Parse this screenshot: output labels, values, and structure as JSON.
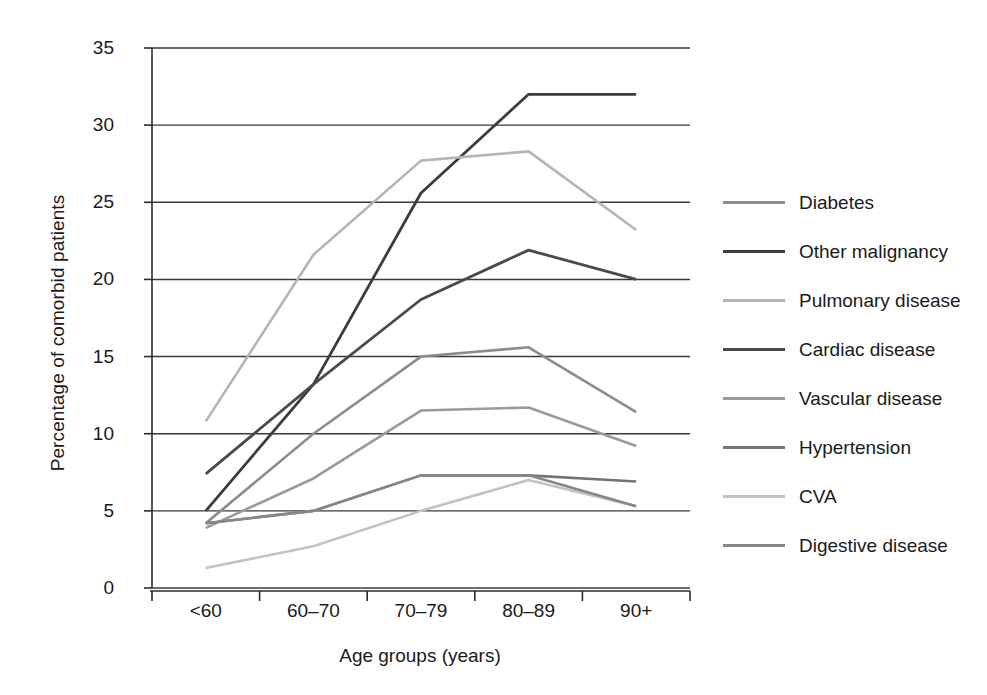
{
  "chart_data": {
    "type": "line",
    "title": "",
    "xlabel": "Age groups (years)",
    "ylabel": "Percentage of comorbid patients",
    "categories": [
      "<60",
      "60–70",
      "70–79",
      "80–89",
      "90+"
    ],
    "ylim": [
      0,
      35
    ],
    "yticks": [
      0,
      5,
      10,
      15,
      20,
      25,
      30,
      35
    ],
    "ytick_labels": [
      "0",
      "5",
      "10",
      "15",
      "20",
      "25",
      "30",
      "35"
    ],
    "grid": "horizontal",
    "legend_position": "right",
    "series": [
      {
        "name": "Diabetes",
        "color": "#8c8c8c",
        "width": 2.6,
        "values": [
          4.2,
          10.0,
          15.0,
          15.6,
          11.4
        ]
      },
      {
        "name": "Other malignancy",
        "color": "#3c3c3c",
        "width": 2.8,
        "values": [
          5.0,
          13.2,
          25.6,
          32.0,
          32.0
        ]
      },
      {
        "name": "Pulmonary disease",
        "color": "#b5b5b5",
        "width": 2.6,
        "values": [
          10.8,
          21.6,
          27.7,
          28.3,
          23.2
        ]
      },
      {
        "name": "Cardiac disease",
        "color": "#4a4a4a",
        "width": 2.8,
        "values": [
          7.4,
          13.2,
          18.7,
          21.9,
          20.0
        ]
      },
      {
        "name": "Vascular disease",
        "color": "#9a9a9a",
        "width": 2.6,
        "values": [
          3.9,
          7.1,
          11.5,
          11.7,
          9.2
        ]
      },
      {
        "name": "Hypertension",
        "color": "#757575",
        "width": 2.6,
        "values": [
          4.2,
          5.0,
          7.3,
          7.3,
          6.9
        ]
      },
      {
        "name": "CVA",
        "color": "#c2c2c2",
        "width": 2.6,
        "values": [
          1.3,
          2.7,
          5.0,
          7.0,
          5.3
        ]
      },
      {
        "name": "Digestive disease",
        "color": "#878787",
        "width": 2.6,
        "values": [
          4.2,
          5.0,
          7.3,
          7.3,
          5.3
        ]
      }
    ]
  },
  "legend": {
    "items": [
      {
        "label": "Diabetes"
      },
      {
        "label": "Other malignancy"
      },
      {
        "label": "Pulmonary disease"
      },
      {
        "label": "Cardiac disease"
      },
      {
        "label": "Vascular disease"
      },
      {
        "label": "Hypertension"
      },
      {
        "label": "CVA"
      },
      {
        "label": "Digestive disease"
      }
    ]
  },
  "axes": {
    "y_title": "Percentage of comorbid patients",
    "x_title": "Age groups (years)"
  },
  "colors": {
    "axis": "#2b2b2b",
    "grid": "#3a3a3a",
    "text": "#1a1a1a",
    "background": "#ffffff"
  }
}
